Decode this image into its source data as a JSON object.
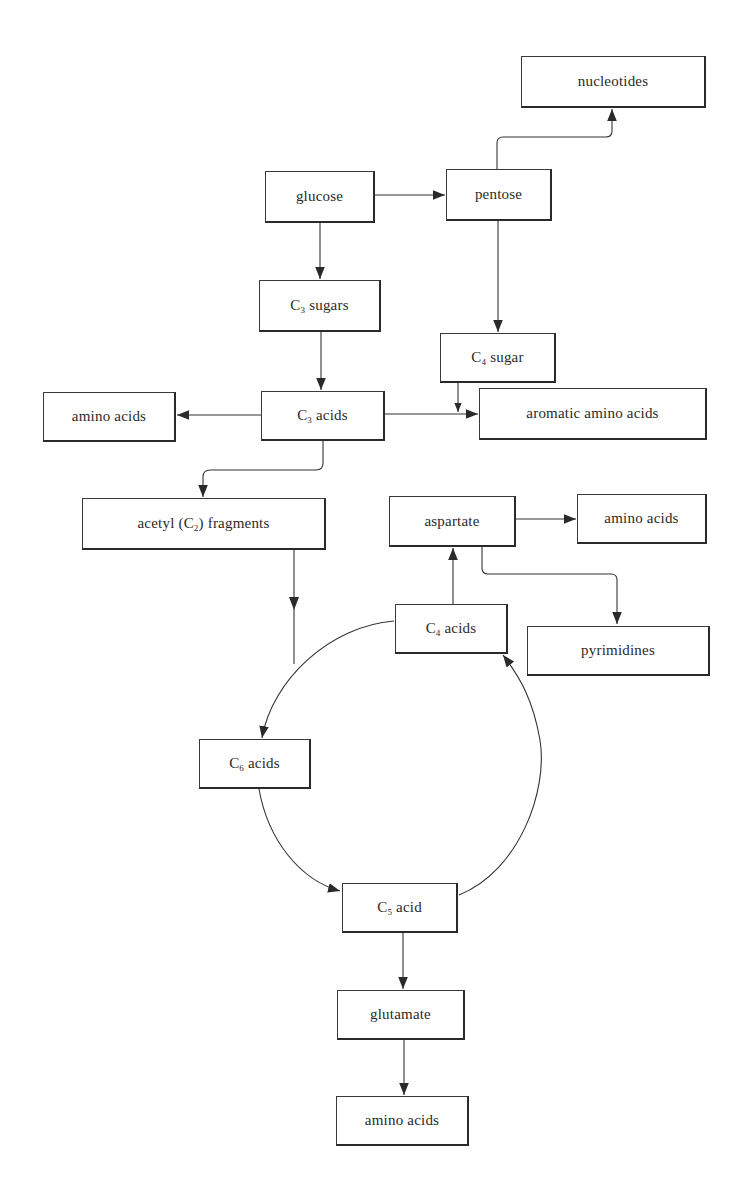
{
  "diagram": {
    "type": "metabolic-pathway-flowchart",
    "nodes": [
      {
        "id": "nucleotides",
        "label": "nucleotides",
        "x": 521,
        "y": 56,
        "w": 185,
        "h": 52
      },
      {
        "id": "glucose",
        "label": "glucose",
        "x": 265,
        "y": 171,
        "w": 110,
        "h": 52
      },
      {
        "id": "pentose",
        "label": "pentose",
        "x": 446,
        "y": 169,
        "w": 106,
        "h": 52
      },
      {
        "id": "c3-sugars",
        "label": "C3 sugars",
        "prefix": "C",
        "sub": "3",
        "suffix": " sugars",
        "x": 259,
        "y": 280,
        "w": 122,
        "h": 52
      },
      {
        "id": "c4-sugar",
        "label": "C4 sugar",
        "prefix": "C",
        "sub": "4",
        "suffix": " sugar",
        "x": 440,
        "y": 333,
        "w": 116,
        "h": 50
      },
      {
        "id": "amino-acids-left",
        "label": "amino acids",
        "x": 43,
        "y": 392,
        "w": 133,
        "h": 50
      },
      {
        "id": "c3-acids",
        "label": "C3 acids",
        "prefix": "C",
        "sub": "3",
        "suffix": " acids",
        "x": 261,
        "y": 391,
        "w": 124,
        "h": 50
      },
      {
        "id": "aromatic-amino-acids",
        "label": "aromatic amino acids",
        "x": 479,
        "y": 388,
        "w": 228,
        "h": 52
      },
      {
        "id": "acetyl-fragments",
        "label": "acetyl (C2) fragments",
        "prefix": "acetyl (C",
        "sub": "2",
        "suffix": ") fragments",
        "x": 82,
        "y": 498,
        "w": 244,
        "h": 52
      },
      {
        "id": "aspartate",
        "label": "aspartate",
        "x": 389,
        "y": 496,
        "w": 127,
        "h": 51
      },
      {
        "id": "amino-acids-right",
        "label": "amino acids",
        "x": 577,
        "y": 494,
        "w": 130,
        "h": 50
      },
      {
        "id": "c4-acids",
        "label": "C4 acids",
        "prefix": "C",
        "sub": "4",
        "suffix": " acids",
        "x": 395,
        "y": 604,
        "w": 113,
        "h": 50
      },
      {
        "id": "pyrimidines",
        "label": "pyrimidines",
        "x": 527,
        "y": 626,
        "w": 183,
        "h": 50
      },
      {
        "id": "c6-acids",
        "label": "C6 acids",
        "prefix": "C",
        "sub": "6",
        "suffix": " acids",
        "x": 199,
        "y": 739,
        "w": 112,
        "h": 50
      },
      {
        "id": "c5-acid",
        "label": "C5 acid",
        "prefix": "C",
        "sub": "5",
        "suffix": " acid",
        "x": 342,
        "y": 883,
        "w": 116,
        "h": 50
      },
      {
        "id": "glutamate",
        "label": "glutamate",
        "x": 337,
        "y": 990,
        "w": 128,
        "h": 50
      },
      {
        "id": "amino-acids-bottom",
        "label": "amino acids",
        "x": 336,
        "y": 1096,
        "w": 133,
        "h": 50
      }
    ],
    "edges": [
      {
        "from": "glucose",
        "to": "pentose"
      },
      {
        "from": "glucose",
        "to": "c3-sugars"
      },
      {
        "from": "pentose",
        "to": "nucleotides"
      },
      {
        "from": "pentose",
        "to": "c4-sugar"
      },
      {
        "from": "c3-sugars",
        "to": "c3-acids"
      },
      {
        "from": "c3-acids",
        "to": "amino-acids-left"
      },
      {
        "from": "c3-acids",
        "to": "aromatic-amino-acids"
      },
      {
        "from": "c4-sugar",
        "to": "aromatic-amino-acids"
      },
      {
        "from": "c3-acids",
        "to": "acetyl-fragments"
      },
      {
        "from": "acetyl-fragments",
        "to": "c6-acids"
      },
      {
        "from": "c4-acids",
        "to": "c6-acids"
      },
      {
        "from": "c6-acids",
        "to": "c5-acid"
      },
      {
        "from": "c5-acid",
        "to": "c4-acids"
      },
      {
        "from": "c4-acids",
        "to": "aspartate"
      },
      {
        "from": "aspartate",
        "to": "amino-acids-right"
      },
      {
        "from": "aspartate",
        "to": "pyrimidines"
      },
      {
        "from": "c5-acid",
        "to": "glutamate"
      },
      {
        "from": "glutamate",
        "to": "amino-acids-bottom"
      }
    ],
    "colors": {
      "line": "#333333",
      "box_border": "#2a2a2a",
      "background": "#ffffff"
    }
  }
}
